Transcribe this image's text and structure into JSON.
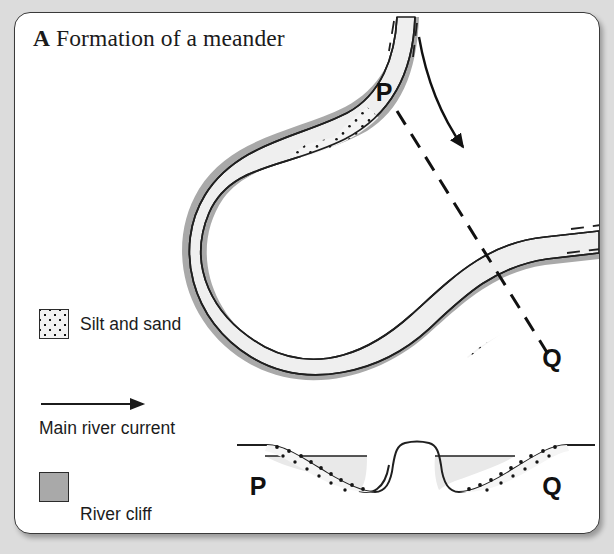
{
  "figure": {
    "panel_label": "A",
    "title": "Formation of a meander"
  },
  "legend": {
    "items": [
      {
        "key": "silt",
        "label": "Silt and sand",
        "symbol": "stipple-swatch"
      },
      {
        "key": "current",
        "label": "Main river current",
        "symbol": "arrow-right-icon"
      },
      {
        "key": "cliff",
        "label": "River cliff",
        "symbol": "gray-swatch"
      }
    ]
  },
  "map_view": {
    "labels": [
      {
        "id": "P",
        "text": "P",
        "x": 369,
        "y": 88
      },
      {
        "id": "Q",
        "text": "Q",
        "x": 537,
        "y": 354
      }
    ],
    "section_line": "dashed P-Q transect",
    "flow_arrow": "main-river-current-arrow"
  },
  "cross_section": {
    "labels": [
      {
        "id": "P",
        "text": "P",
        "x": 243,
        "y": 482
      },
      {
        "id": "Q",
        "text": "Q",
        "x": 537,
        "y": 482
      }
    ],
    "features": [
      "gentle slip-off slope with silt and sand at P",
      "steep river cliff on inner side of left channel",
      "central land between channels",
      "steep river cliff on left of right channel",
      "gentle slip-off slope with silt and sand at Q"
    ]
  },
  "colors": {
    "page_background": "#dcdcdc",
    "card_background": "#ffffff",
    "outline": "#1f1f1f",
    "water": "#efefef",
    "river_cliff": "#a9a9a9",
    "silt_fill": "#f2f2f2",
    "stipple_dot": "#141414",
    "text": "#1b1b1b"
  }
}
